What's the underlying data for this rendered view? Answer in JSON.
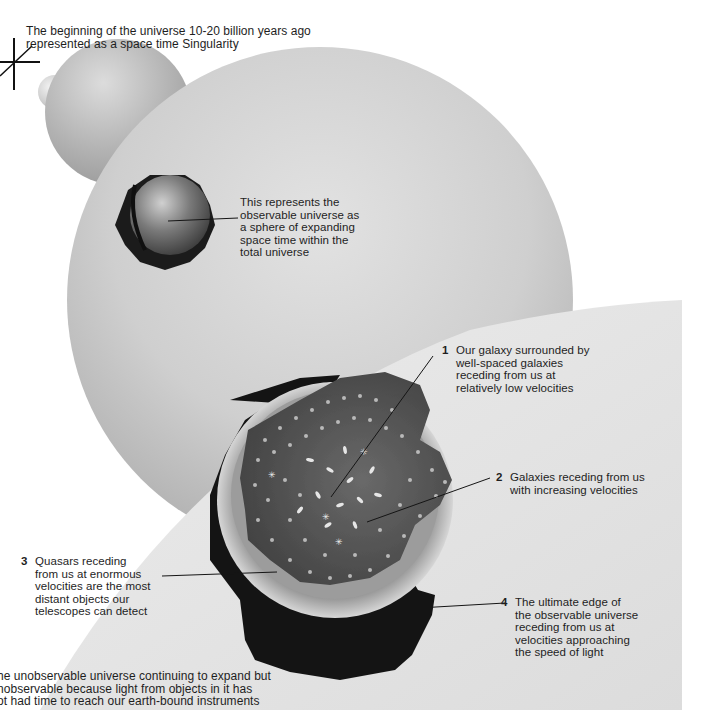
{
  "diagram": {
    "labels": {
      "singularity": {
        "line1": "The beginning of the universe 10-20 billion years ago",
        "line2": "represented as a space time Singularity"
      },
      "observable_sphere": {
        "lines": [
          "This represents the",
          "observable universe as",
          "a sphere of expanding",
          "space time within the",
          "total universe"
        ]
      },
      "callouts": [
        {
          "number": "1",
          "lines": [
            "Our galaxy surrounded by",
            "well-spaced galaxies",
            "receding from us at",
            "relatively low velocities"
          ]
        },
        {
          "number": "2",
          "lines": [
            "Galaxies receding from us",
            "with increasing velocities"
          ]
        },
        {
          "number": "3",
          "lines": [
            "Quasars receding",
            "from us at enormous",
            "velocities are the most",
            "distant objects our",
            "telescopes can detect"
          ]
        },
        {
          "number": "4",
          "lines": [
            "The ultimate edge of",
            "the observable universe",
            "receding from us at",
            "velocities approaching",
            "the speed of light"
          ]
        }
      ],
      "unobservable": {
        "lines": [
          "he unobservable universe continuing to expand but",
          "nobservable because light from objects in it has",
          "ot had time to reach our earth-bound instruments"
        ]
      }
    },
    "colors": {
      "background": "#ffffff",
      "sphere_light": "#e6e6e6",
      "sphere_mid": "#bdbdbd",
      "sphere_dark": "#8c8c8c",
      "panel": "#e2e2e2",
      "cutaway_dark": "#151515",
      "galaxy_field": "#555555",
      "galaxy_dots": "#d8d8d8",
      "text": "#1e1e1e"
    }
  }
}
